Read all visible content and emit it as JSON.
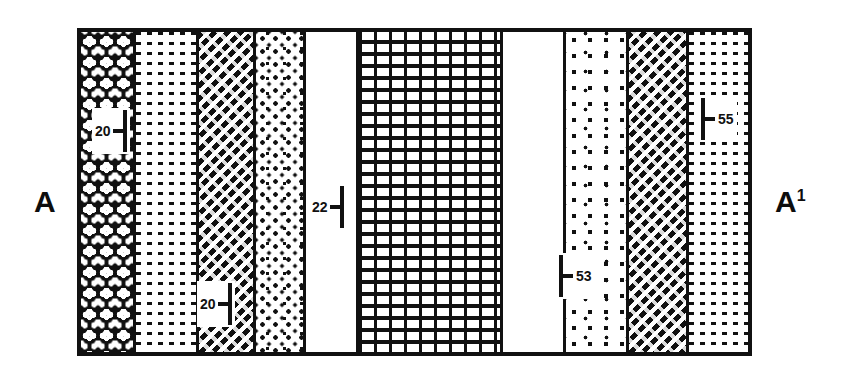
{
  "figure": {
    "left_end_label": "A",
    "right_end_label": "A",
    "right_end_superscript": "1",
    "frame_color": "#111111",
    "background_color": "#ffffff"
  },
  "columns": [
    {
      "id": "unit-1",
      "pattern": "crystalline",
      "pattern_label": "crystalline-igneous-rock",
      "width_px": 56
    },
    {
      "id": "unit-2",
      "pattern": "dash",
      "pattern_label": "shale-dash-grid",
      "width_px": 63
    },
    {
      "id": "unit-3",
      "pattern": "diag",
      "pattern_label": "diagonal-dash-hatch",
      "width_px": 58
    },
    {
      "id": "unit-4",
      "pattern": "stipple",
      "pattern_label": "sandstone-stipple",
      "width_px": 51
    },
    {
      "id": "unit-5",
      "pattern": "blank",
      "pattern_label": "blank-unexposed",
      "width_px": 53
    },
    {
      "id": "unit-6",
      "pattern": "brick",
      "pattern_label": "limestone-brick",
      "width_px": 146
    },
    {
      "id": "unit-7",
      "pattern": "blank",
      "pattern_label": "blank-unexposed",
      "width_px": 64
    },
    {
      "id": "unit-8",
      "pattern": "stipple-loose",
      "pattern_label": "sandstone-stipple-coarse",
      "width_px": 64
    },
    {
      "id": "unit-9",
      "pattern": "diag",
      "pattern_label": "diagonal-dash-hatch",
      "width_px": 60
    },
    {
      "id": "unit-10",
      "pattern": "dash",
      "pattern_label": "shale-dash-grid",
      "width_px": 60
    }
  ],
  "markers": [
    {
      "id": "marker-20-upper",
      "value": "20",
      "orientation": "number-left",
      "column": "unit-1",
      "left_px": 92,
      "top_px": 108
    },
    {
      "id": "marker-20-lower",
      "value": "20",
      "orientation": "number-left",
      "column": "unit-3",
      "left_px": 197,
      "top_px": 281
    },
    {
      "id": "marker-22",
      "value": "22",
      "orientation": "number-left",
      "column": "unit-5",
      "left_px": 309,
      "top_px": 184
    },
    {
      "id": "marker-53",
      "value": "53",
      "orientation": "number-right",
      "column": "unit-8",
      "left_px": 556,
      "top_px": 253
    },
    {
      "id": "marker-55",
      "value": "55",
      "orientation": "number-right",
      "column": "unit-10",
      "left_px": 698,
      "top_px": 96
    }
  ]
}
